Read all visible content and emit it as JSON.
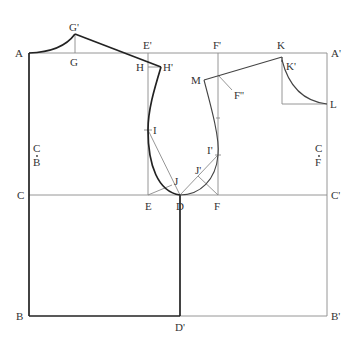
{
  "diagram": {
    "type": "garment pattern draft (bodice block)",
    "background": "#ffffff",
    "line_colors": {
      "construction": "#8a8a8a",
      "outline": "#222222"
    },
    "labels": {
      "A": "A",
      "A_prime": "A'",
      "G": "G",
      "G_prime": "G'",
      "E_prime": "E'",
      "F_prime": "F'",
      "K": "K",
      "K_prime": "K'",
      "L": "L",
      "H": "H",
      "H_prime": "H'",
      "M": "M",
      "F_double_prime": "F''",
      "I": "I",
      "I_prime": "I'",
      "J": "J",
      "J_prime": "J'",
      "C": "C",
      "C_prime": "C'",
      "E": "E",
      "D": "D",
      "F": "F",
      "B": "B",
      "B_prime": "B'",
      "D_prime": "D'",
      "CB_top": "C",
      "CB_bottom": "B",
      "CF_top": "C",
      "CF_bottom": "F"
    },
    "points": {
      "A": [
        29,
        53
      ],
      "A_prime": [
        327,
        53
      ],
      "G": [
        75,
        53
      ],
      "G_prime": [
        75,
        34
      ],
      "E_prime": [
        148,
        53
      ],
      "F_prime": [
        218,
        53
      ],
      "K": [
        282,
        57
      ],
      "K_prime": [
        282,
        57
      ],
      "L": [
        327,
        104
      ],
      "H": [
        148,
        67
      ],
      "H_prime": [
        161,
        67
      ],
      "M": [
        204,
        80
      ],
      "F_double_prime": [
        218,
        75
      ],
      "I": [
        148,
        130
      ],
      "I_prime": [
        218,
        155
      ],
      "J": [
        172,
        185
      ],
      "J_prime": [
        198,
        176
      ],
      "C": [
        29,
        195
      ],
      "C_prime": [
        327,
        195
      ],
      "E": [
        148,
        195
      ],
      "D": [
        180,
        195
      ],
      "F": [
        218,
        195
      ],
      "B": [
        29,
        316
      ],
      "D_prime": [
        180,
        316
      ],
      "B_prime": [
        327,
        316
      ]
    }
  }
}
